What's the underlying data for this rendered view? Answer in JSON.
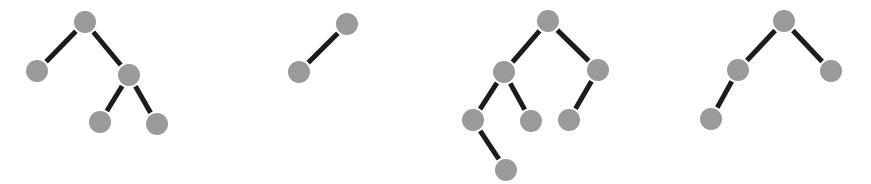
{
  "figure": {
    "title": "",
    "type": "node-link-graphs",
    "width": 871,
    "height": 184,
    "background_color": "#ffffff",
    "node_color": "#9a9a9a",
    "edge_color": "#1c1c1c",
    "node_radius": 11,
    "edge_width": 5,
    "graph_count": 4
  },
  "graphs": [
    {
      "id": "graph-1",
      "name": "tree-1",
      "node_count": 5,
      "edge_count": 4,
      "nodes": [
        {
          "id": "g1n0",
          "label": "",
          "x": 85,
          "y": 22
        },
        {
          "id": "g1n1",
          "label": "",
          "x": 37,
          "y": 71
        },
        {
          "id": "g1n2",
          "label": "",
          "x": 129,
          "y": 75
        },
        {
          "id": "g1n3",
          "label": "",
          "x": 100,
          "y": 122
        },
        {
          "id": "g1n4",
          "label": "",
          "x": 157,
          "y": 124
        }
      ],
      "edges": [
        {
          "source": "g1n0",
          "target": "g1n1"
        },
        {
          "source": "g1n0",
          "target": "g1n2"
        },
        {
          "source": "g1n2",
          "target": "g1n3"
        },
        {
          "source": "g1n2",
          "target": "g1n4"
        }
      ]
    },
    {
      "id": "graph-2",
      "name": "tree-2",
      "node_count": 2,
      "edge_count": 1,
      "nodes": [
        {
          "id": "g2n0",
          "label": "",
          "x": 347,
          "y": 24
        },
        {
          "id": "g2n1",
          "label": "",
          "x": 299,
          "y": 72
        }
      ],
      "edges": [
        {
          "source": "g2n0",
          "target": "g2n1"
        }
      ]
    },
    {
      "id": "graph-3",
      "name": "tree-3",
      "node_count": 7,
      "edge_count": 6,
      "nodes": [
        {
          "id": "g3n0",
          "label": "",
          "x": 548,
          "y": 21
        },
        {
          "id": "g3n1",
          "label": "",
          "x": 504,
          "y": 72
        },
        {
          "id": "g3n2",
          "label": "",
          "x": 598,
          "y": 70
        },
        {
          "id": "g3n3",
          "label": "",
          "x": 473,
          "y": 120
        },
        {
          "id": "g3n4",
          "label": "",
          "x": 531,
          "y": 121
        },
        {
          "id": "g3n5",
          "label": "",
          "x": 569,
          "y": 120
        },
        {
          "id": "g3n6",
          "label": "",
          "x": 506,
          "y": 170
        }
      ],
      "edges": [
        {
          "source": "g3n0",
          "target": "g3n1"
        },
        {
          "source": "g3n0",
          "target": "g3n2"
        },
        {
          "source": "g3n1",
          "target": "g3n3"
        },
        {
          "source": "g3n1",
          "target": "g3n4"
        },
        {
          "source": "g3n2",
          "target": "g3n5"
        },
        {
          "source": "g3n3",
          "target": "g3n6"
        }
      ]
    },
    {
      "id": "graph-4",
      "name": "tree-4",
      "node_count": 4,
      "edge_count": 3,
      "nodes": [
        {
          "id": "g4n0",
          "label": "",
          "x": 784,
          "y": 21
        },
        {
          "id": "g4n1",
          "label": "",
          "x": 738,
          "y": 70
        },
        {
          "id": "g4n2",
          "label": "",
          "x": 831,
          "y": 71
        },
        {
          "id": "g4n3",
          "label": "",
          "x": 711,
          "y": 119
        }
      ],
      "edges": [
        {
          "source": "g4n0",
          "target": "g4n1"
        },
        {
          "source": "g4n0",
          "target": "g4n2"
        },
        {
          "source": "g4n1",
          "target": "g4n3"
        }
      ]
    }
  ]
}
